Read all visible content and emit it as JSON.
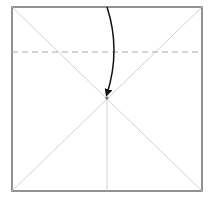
{
  "diagram": {
    "type": "origami-fold-step",
    "paper": {
      "x1": 12,
      "y1": 7,
      "x2": 202,
      "y2": 191,
      "edge_color": "#777777",
      "fill": "#ffffff"
    },
    "crease_lines": [
      {
        "name": "diagonal-tl-br",
        "x1": 12,
        "y1": 7,
        "x2": 202,
        "y2": 191
      },
      {
        "name": "diagonal-tr-bl",
        "x1": 202,
        "y1": 7,
        "x2": 12,
        "y2": 191
      },
      {
        "name": "vertical-lower-half",
        "x1": 107,
        "y1": 98,
        "x2": 107,
        "y2": 191
      }
    ],
    "crease_color": "#cccccc",
    "valley_fold_line": {
      "x1": 12,
      "y1": 52,
      "x2": 202,
      "y2": 52,
      "color": "#aaaaaa",
      "dash": "6,4"
    },
    "fold_arrow": {
      "from": [
        107,
        7
      ],
      "control": [
        121,
        50
      ],
      "to": [
        107,
        96
      ],
      "color": "#111111"
    },
    "center_point": {
      "x": 107,
      "y": 98,
      "color": "#777777"
    }
  }
}
